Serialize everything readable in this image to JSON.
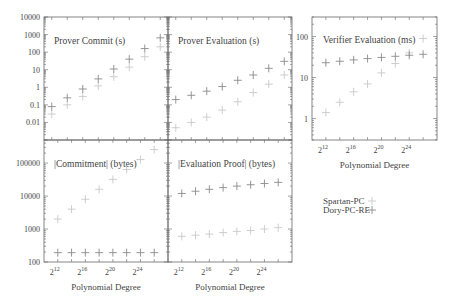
{
  "chart_data": [
    {
      "type": "scatter",
      "title": "Prover Commit (s)",
      "xlabel": "",
      "ylabel": "",
      "yscale": "log",
      "ylim": [
        0.001,
        10000
      ],
      "yticks": [
        "0.01",
        "0.1",
        "1",
        "10",
        "100",
        "1000",
        "10000"
      ],
      "x": [
        12,
        14,
        16,
        18,
        20,
        22,
        24,
        26
      ],
      "series": [
        {
          "name": "Spartan-PC",
          "values": [
            0.03,
            0.1,
            0.3,
            1.2,
            4,
            14,
            55,
            200
          ]
        },
        {
          "name": "Dory-PC-RE",
          "values": [
            0.08,
            0.25,
            0.8,
            3,
            11,
            40,
            160,
            650
          ]
        }
      ]
    },
    {
      "type": "scatter",
      "title": "Prover Evaluation (s)",
      "xlabel": "",
      "ylabel": "",
      "yscale": "log",
      "ylim": [
        0.001,
        10000
      ],
      "x": [
        12,
        14,
        16,
        18,
        20,
        22,
        24,
        26
      ],
      "series": [
        {
          "name": "Spartan-PC",
          "values": [
            0.005,
            0.01,
            0.02,
            0.05,
            0.15,
            0.5,
            1.5,
            5
          ]
        },
        {
          "name": "Dory-PC-RE",
          "values": [
            0.2,
            0.35,
            0.6,
            1.1,
            2.5,
            5,
            12,
            30
          ]
        }
      ]
    },
    {
      "type": "scatter",
      "title": "Verifier Evaluation (ms)",
      "xlabel": "Polynomial Degree",
      "ylabel": "",
      "yscale": "log",
      "ylim": [
        0.3,
        300
      ],
      "yticks": [
        "1",
        "10",
        "100"
      ],
      "xticks": [
        "2^12",
        "2^16",
        "2^20",
        "2^24"
      ],
      "x": [
        12,
        14,
        16,
        18,
        20,
        22,
        24,
        26
      ],
      "series": [
        {
          "name": "Spartan-PC",
          "values": [
            1.4,
            2.5,
            4.5,
            7,
            13,
            22,
            40,
            90
          ]
        },
        {
          "name": "Dory-PC-RE",
          "values": [
            23,
            25,
            27,
            29,
            31,
            33,
            35,
            37
          ]
        }
      ]
    },
    {
      "type": "scatter",
      "title": "|Commitment| (bytes)",
      "xlabel": "Polynomial Degree",
      "ylabel": "",
      "yscale": "log",
      "ylim": [
        100,
        500000
      ],
      "yticks": [
        "100",
        "1000",
        "10000",
        "100000"
      ],
      "xticks": [
        "2^12",
        "2^16",
        "2^20",
        "2^24"
      ],
      "x": [
        12,
        14,
        16,
        18,
        20,
        22,
        24,
        26
      ],
      "series": [
        {
          "name": "Spartan-PC",
          "values": [
            2000,
            4000,
            8000,
            16000,
            32000,
            64000,
            128000,
            256000
          ]
        },
        {
          "name": "Dory-PC-RE",
          "values": [
            192,
            192,
            192,
            192,
            192,
            192,
            192,
            192
          ]
        }
      ]
    },
    {
      "type": "scatter",
      "title": "|Evaluation Proof| (bytes)",
      "xlabel": "Polynomial Degree",
      "ylabel": "",
      "yscale": "log",
      "ylim": [
        100,
        500000
      ],
      "xticks": [
        "2^12",
        "2^16",
        "2^20",
        "2^24"
      ],
      "x": [
        12,
        14,
        16,
        18,
        20,
        22,
        24,
        26
      ],
      "series": [
        {
          "name": "Spartan-PC",
          "values": [
            600,
            650,
            700,
            780,
            850,
            900,
            1000,
            1100
          ]
        },
        {
          "name": "Dory-PC-RE",
          "values": [
            12000,
            14000,
            16000,
            18000,
            20000,
            22000,
            24000,
            26000
          ]
        }
      ]
    }
  ],
  "legend": {
    "entries": [
      {
        "label": "Spartan-PC",
        "color": "#c8c8c8"
      },
      {
        "label": "Dory-PC-RE",
        "color": "#8a8a8a"
      }
    ]
  },
  "labels": {
    "x_axis_title": "Polynomial Degree",
    "x_tick_base": "2",
    "x_tick_exponents": [
      "12",
      "16",
      "20",
      "24"
    ]
  }
}
